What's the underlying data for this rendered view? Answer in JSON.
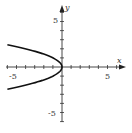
{
  "chart_data": {
    "type": "line",
    "title": "",
    "xlabel": "x",
    "ylabel": "y",
    "xlim": [
      -6,
      7
    ],
    "ylim": [
      -6,
      7
    ],
    "grid": false,
    "legend": null,
    "x_tick_labels": [
      "-5",
      "5"
    ],
    "y_tick_labels": [
      "5",
      "-5"
    ],
    "tick_step": 1,
    "series": [
      {
        "name": "x = -y^2",
        "equation": "x = -y^2",
        "description": "Parabola with vertex at origin, opening left",
        "points": [
          {
            "x": -6.25,
            "y": 2.5
          },
          {
            "x": -4,
            "y": 2
          },
          {
            "x": -2.25,
            "y": 1.5
          },
          {
            "x": -1,
            "y": 1
          },
          {
            "x": -0.25,
            "y": 0.5
          },
          {
            "x": 0,
            "y": 0
          },
          {
            "x": -0.25,
            "y": -0.5
          },
          {
            "x": -1,
            "y": -1
          },
          {
            "x": -2.25,
            "y": -1.5
          },
          {
            "x": -4,
            "y": -2
          },
          {
            "x": -6.25,
            "y": -2.5
          }
        ]
      }
    ]
  },
  "labels": {
    "x_axis": "x",
    "y_axis": "y",
    "x_neg5": "-5",
    "x_pos5": "5",
    "y_pos5": "5",
    "y_neg5": "-5"
  },
  "colors": {
    "axis": "#333333",
    "curve": "#111111",
    "background": "#ffffff"
  }
}
